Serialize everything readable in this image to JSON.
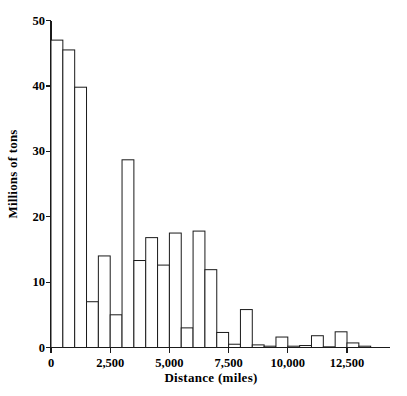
{
  "chart_data": {
    "type": "bar",
    "title": "",
    "subtitle": "",
    "xlabel": "Distance (miles)",
    "ylabel": "Millions of tons",
    "xlim": [
      0,
      14000
    ],
    "ylim": [
      0,
      50
    ],
    "grid": false,
    "legend": null,
    "bin_width": 500,
    "xticks": [
      0,
      2500,
      5000,
      7500,
      10000,
      12500
    ],
    "xtick_labels": [
      "0",
      "2,500",
      "5,000",
      "7,500",
      "10,000",
      "12,500"
    ],
    "yticks": [
      0,
      10,
      20,
      30,
      40,
      50
    ],
    "ytick_labels": [
      "0",
      "10",
      "20",
      "30",
      "40",
      "50"
    ],
    "bin_starts": [
      0,
      500,
      1000,
      1500,
      2000,
      2500,
      3000,
      3500,
      4000,
      4500,
      5000,
      5500,
      6000,
      6500,
      7000,
      7500,
      8000,
      8500,
      9000,
      9500,
      10000,
      10500,
      11000,
      11500,
      12000,
      12500,
      13000,
      13500
    ],
    "bin_ends": [
      500,
      1000,
      1500,
      2000,
      2500,
      3000,
      3500,
      4000,
      4500,
      5000,
      5500,
      6000,
      6500,
      7000,
      7500,
      8000,
      8500,
      9000,
      9500,
      10000,
      10500,
      11000,
      11500,
      12000,
      12500,
      13000,
      13500,
      14000
    ],
    "categories": [
      "0-500",
      "500-1,000",
      "1,000-1,500",
      "1,500-2,000",
      "2,000-2,500",
      "2,500-3,000",
      "3,000-3,500",
      "3,500-4,000",
      "4,000-4,500",
      "4,500-5,000",
      "5,000-5,500",
      "5,500-6,000",
      "6,000-6,500",
      "6,500-7,000",
      "7,000-7,500",
      "7,500-8,000",
      "8,000-8,500",
      "8,500-9,000",
      "9,000-9,500",
      "9,500-10,000",
      "10,000-10,500",
      "10,500-11,000",
      "11,000-11,500",
      "11,500-12,000",
      "12,000-12,500",
      "12,500-13,000",
      "13,000-13,500",
      "13,500-14,000"
    ],
    "values": [
      47,
      45.5,
      39.8,
      7,
      14,
      5,
      28.7,
      13.3,
      16.8,
      12.6,
      17.5,
      3,
      17.8,
      11.9,
      2.3,
      0.5,
      5.8,
      0.4,
      0.2,
      1.6,
      0.2,
      0.3,
      1.8,
      0.1,
      2.4,
      0.7,
      0.2,
      0.0
    ]
  },
  "axis": {
    "y_axis_name": "y-axis",
    "x_axis_name": "x-axis"
  },
  "style": {
    "bar_fill": "#ffffff",
    "bar_stroke": "#1a1a1a",
    "axis_color": "#1a1a1a"
  }
}
